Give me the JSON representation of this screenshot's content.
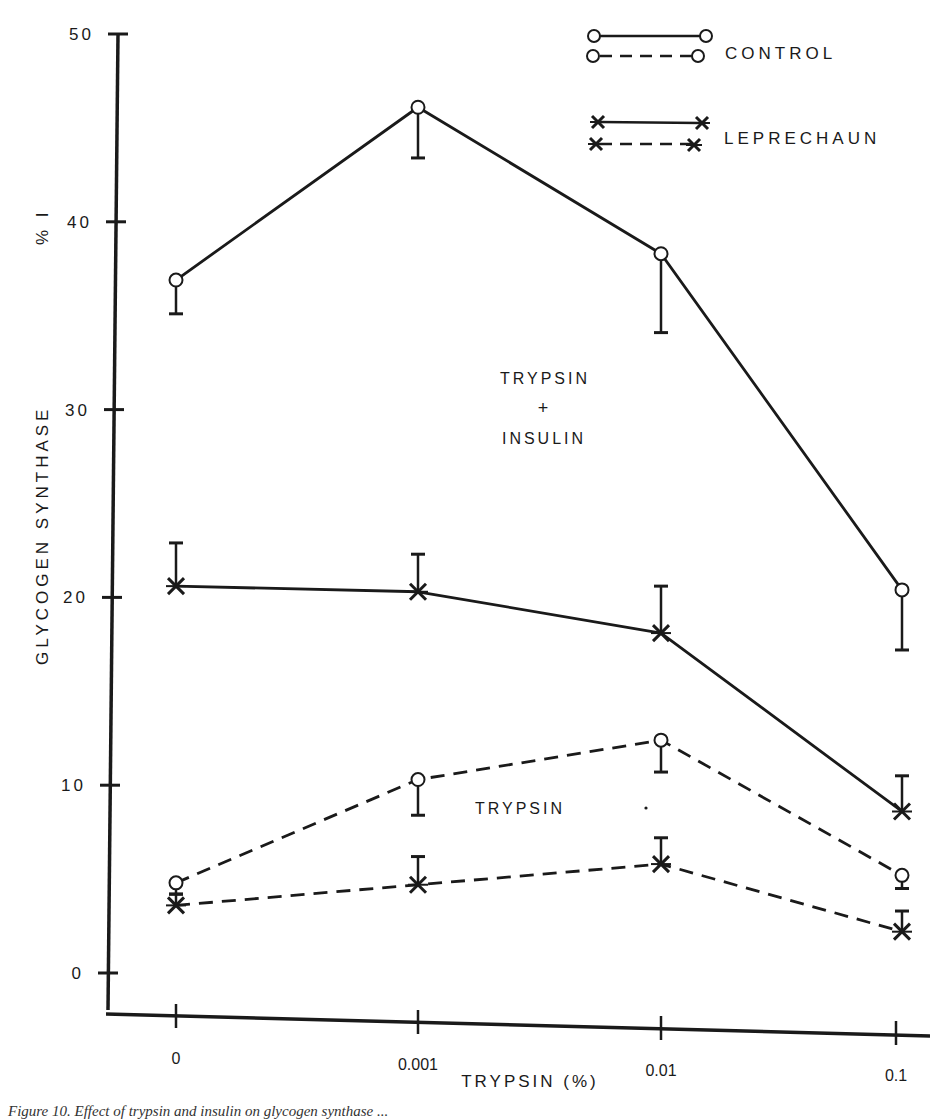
{
  "chart_data": {
    "type": "line",
    "title": "",
    "xlabel": "TRYPSIN (%)",
    "ylabel": "GLYCOGEN SYNTHASE %I",
    "categories": [
      "0",
      "0.001",
      "0.01",
      "0.1"
    ],
    "yticks": [
      0,
      10,
      20,
      30,
      40,
      50
    ],
    "ylim": [
      0,
      50
    ],
    "grid": false,
    "legend_position": "top-right",
    "legend": [
      {
        "label": "CONTROL",
        "markers": "open-circle",
        "styles": [
          "solid",
          "dashed"
        ]
      },
      {
        "label": "LEPRECHAUN",
        "markers": "x-cross",
        "styles": [
          "solid",
          "dashed"
        ]
      }
    ],
    "annotations": [
      {
        "text": "TRYPSIN + INSULIN",
        "near_series": "solid lines"
      },
      {
        "text": "TRYPSIN",
        "near_series": "dashed lines"
      }
    ],
    "series": [
      {
        "name": "Control, Trypsin + Insulin",
        "marker": "circle",
        "style": "solid",
        "values": [
          36.9,
          46.1,
          38.3,
          20.4
        ],
        "error_ends": [
          35.1,
          43.4,
          34.1,
          17.2
        ]
      },
      {
        "name": "Leprechaun, Trypsin + Insulin",
        "marker": "x",
        "style": "solid",
        "values": [
          20.6,
          20.3,
          18.1,
          8.6
        ],
        "error_ends": [
          22.9,
          22.3,
          20.6,
          10.5
        ]
      },
      {
        "name": "Control, Trypsin",
        "marker": "circle",
        "style": "dashed",
        "values": [
          4.8,
          10.3,
          12.4,
          5.2
        ],
        "error_ends": [
          4.2,
          8.4,
          10.7,
          4.5
        ]
      },
      {
        "name": "Leprechaun, Trypsin",
        "marker": "x",
        "style": "dashed",
        "values": [
          3.6,
          4.7,
          5.8,
          2.2
        ],
        "error_ends": [
          4.2,
          6.2,
          7.2,
          3.3
        ]
      }
    ]
  },
  "labels": {
    "ylabel_main": "GLYCOGEN SYNTHASE",
    "ylabel_suffix": "% I",
    "xlabel": "TRYPSIN (%)",
    "legend_control": "CONTROL",
    "legend_leprechaun": "LEPRECHAUN",
    "annot_trypsin_insulin_1": "TRYPSIN",
    "annot_trypsin_insulin_2": "+",
    "annot_trypsin_insulin_3": "INSULIN",
    "annot_trypsin": "TRYPSIN",
    "caption": "Figure 10.  Effect of trypsin and insulin on glycogen synthase ..."
  },
  "colors": {
    "ink": "#1a1a1a",
    "background": "#ffffff"
  }
}
